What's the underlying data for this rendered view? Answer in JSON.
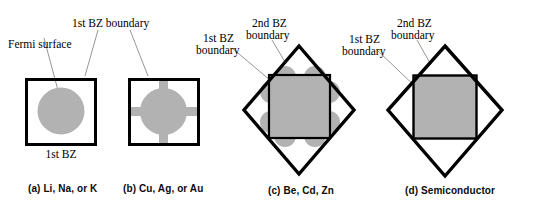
{
  "figure": {
    "kind": "brillouin-zone-fermi-surface-diagram",
    "width": 543,
    "height": 213,
    "colors": {
      "fermi_fill": "#b2b2b2",
      "boundary_stroke": "#000000",
      "leader_stroke": "#808080",
      "background": "#ffffff"
    }
  },
  "annotations": {
    "fermi_surface": "Fermi surface",
    "first_bz_boundary": "1st BZ boundary",
    "first_bz": "1st BZ",
    "first_bz_two_line_a": "1st BZ",
    "first_bz_two_line_b": "boundary",
    "second_bz_two_line_a": "2nd BZ",
    "second_bz_two_line_b": "boundary"
  },
  "panels": [
    {
      "id": "a",
      "caption": "(a) Li, Na, or K",
      "shape": "circle-in-square",
      "zones": [
        "1st BZ"
      ],
      "labels": [
        "Fermi surface",
        "1st BZ boundary",
        "1st BZ"
      ]
    },
    {
      "id": "b",
      "caption": "(b) Cu, Ag, or Au",
      "shape": "circle-with-necks-in-square",
      "zones": [
        "1st BZ"
      ],
      "labels": [
        "1st BZ boundary"
      ]
    },
    {
      "id": "c",
      "caption": "(c) Be, Cd, Zn",
      "shape": "lobed-square-in-square-and-diamond",
      "zones": [
        "1st BZ",
        "2nd BZ"
      ],
      "labels": [
        "1st BZ boundary",
        "2nd BZ boundary"
      ]
    },
    {
      "id": "d",
      "caption": "(d) Semiconductor",
      "shape": "filled-square-in-square-and-diamond",
      "zones": [
        "1st BZ",
        "2nd BZ"
      ],
      "labels": [
        "1st BZ boundary",
        "2nd BZ boundary"
      ]
    }
  ]
}
